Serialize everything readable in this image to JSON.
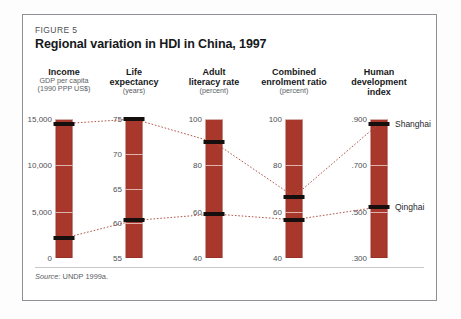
{
  "figure": {
    "label": "FIGURE 5",
    "title": "Regional variation in HDI in China, 1997",
    "source_prefix": "Source:",
    "source_text": "UNDP 1999a."
  },
  "style": {
    "bar_color": "#a8382c",
    "marker_color": "#15100e",
    "connector_color": "#b0564a",
    "border_color": "#8d9196"
  },
  "regions": [
    {
      "name": "Shanghai",
      "label_axis": 4
    },
    {
      "name": "Qinghai",
      "label_axis": 4
    }
  ],
  "chart_data": {
    "type": "line",
    "title": "Regional variation in HDI in China, 1997",
    "subtitle": "",
    "xlabel": "",
    "ylabel": "",
    "grid": true,
    "legend_position": "inline-right",
    "note": "Parallel-axis (slope) chart: five independent vertical scales, each drawn as a red bar; black markers show the value for Shanghai (highest HDI) and Qinghai (lowest HDI), joined across axes by dotted connectors.",
    "categories": [
      "Income",
      "Life expectancy",
      "Adult literacy rate",
      "Combined enrolment ratio",
      "Human development index"
    ],
    "axes": [
      {
        "name": "Income",
        "header_line1": "Income",
        "header_line2": "",
        "sub1": "GDP per capita",
        "sub2": "(1990 PPP US$)",
        "ticks": [
          "0",
          "5,000",
          "10,000",
          "15,000"
        ],
        "tick_values": [
          0,
          5000,
          10000,
          15000
        ],
        "ylim": [
          0,
          15000
        ]
      },
      {
        "name": "Life expectancy",
        "header_line1": "Life",
        "header_line2": "expectancy",
        "sub1": "(years)",
        "sub2": "",
        "ticks": [
          "55",
          "60",
          "65",
          "70",
          "75"
        ],
        "tick_values": [
          55,
          60,
          65,
          70,
          75
        ],
        "ylim": [
          55,
          75
        ]
      },
      {
        "name": "Adult literacy rate",
        "header_line1": "Adult",
        "header_line2": "literacy rate",
        "sub1": "(percent)",
        "sub2": "",
        "ticks": [
          "40",
          "60",
          "80",
          "100"
        ],
        "tick_values": [
          40,
          60,
          80,
          100
        ],
        "ylim": [
          40,
          100
        ]
      },
      {
        "name": "Combined enrolment ratio",
        "header_line1": "Combined",
        "header_line2": "enrolment ratio",
        "sub1": "(percent)",
        "sub2": "",
        "ticks": [
          "40",
          "60",
          "80",
          "100"
        ],
        "tick_values": [
          40,
          60,
          80,
          100
        ],
        "ylim": [
          40,
          100
        ]
      },
      {
        "name": "Human development index",
        "header_line1": "Human",
        "header_line2": "development",
        "header_line3": "index",
        "sub1": "",
        "sub2": "",
        "ticks": [
          ".300",
          ".500",
          ".700",
          ".900"
        ],
        "tick_values": [
          0.3,
          0.5,
          0.7,
          0.9
        ],
        "ylim": [
          0.3,
          0.9
        ]
      }
    ],
    "series": [
      {
        "name": "Shanghai",
        "values": [
          14500,
          75.0,
          90.0,
          66.5,
          0.88
        ]
      },
      {
        "name": "Qinghai",
        "values": [
          2150,
          60.4,
          59.0,
          56.5,
          0.52
        ]
      }
    ]
  }
}
